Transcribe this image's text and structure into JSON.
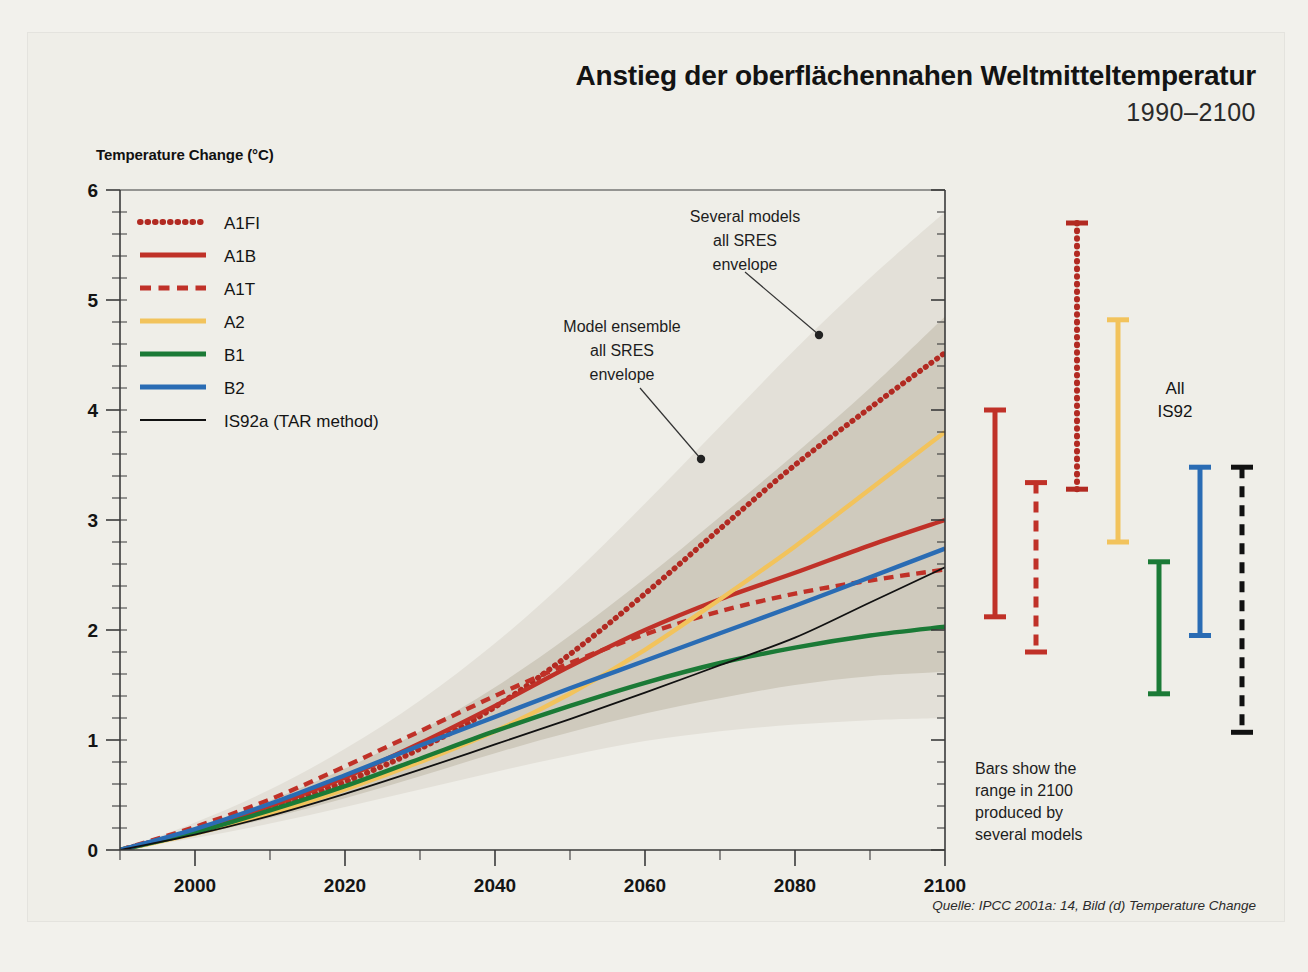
{
  "header": {
    "title": "Anstieg der oberflächennahen Weltmitteltemperatur",
    "subtitle": "1990–2100"
  },
  "source": "Quelle: IPCC 2001a: 14, Bild (d) Temperature Change",
  "axis": {
    "ylabel": "Temperature Change (°C)",
    "yticks": [
      "0",
      "1",
      "2",
      "3",
      "4",
      "5",
      "6"
    ],
    "xticks": [
      "2000",
      "2020",
      "2040",
      "2060",
      "2080",
      "2100"
    ]
  },
  "legend": {
    "items": [
      {
        "label": "A1FI",
        "color": "#b22a22",
        "style": "dotted"
      },
      {
        "label": "A1B",
        "color": "#c03128",
        "style": "solid"
      },
      {
        "label": "A1T",
        "color": "#c03128",
        "style": "dashed"
      },
      {
        "label": "A2",
        "color": "#f2c35c",
        "style": "solid"
      },
      {
        "label": "B1",
        "color": "#1b7a36",
        "style": "solid"
      },
      {
        "label": "B2",
        "color": "#2a6cb4",
        "style": "solid"
      },
      {
        "label": "IS92a (TAR method)",
        "color": "#111111",
        "style": "thin"
      }
    ]
  },
  "annotations": {
    "several_models": "Several models\nall SRES\nenvelope",
    "several_models_lines": [
      "Several models",
      "all SRES",
      "envelope"
    ],
    "model_ensemble_lines": [
      "Model ensemble",
      "all SRES",
      "envelope"
    ],
    "bars_note_lines": [
      "Bars show the",
      "range in 2100",
      "produced by",
      "several models"
    ],
    "all_is92_lines": [
      "All",
      "IS92"
    ]
  },
  "colors": {
    "outer_envelope": "#e3e0d8",
    "inner_envelope": "#cfcabd",
    "paper": "#f2f1ec",
    "panel": "#efeee8",
    "axis": "#3a3a3a"
  },
  "chart_data": {
    "type": "line",
    "title": "Anstieg der oberflächennahen Weltmitteltemperatur 1990–2100",
    "xlabel": "",
    "ylabel": "Temperature Change (°C)",
    "xlim": [
      1990,
      2100
    ],
    "ylim": [
      0,
      6
    ],
    "grid": false,
    "legend_position": "upper-left-inside",
    "x": [
      1990,
      2000,
      2010,
      2020,
      2030,
      2040,
      2050,
      2060,
      2070,
      2080,
      2090,
      2100
    ],
    "series": [
      {
        "name": "A1FI",
        "color": "#b22a22",
        "style": "dotted",
        "values": [
          0.0,
          0.17,
          0.38,
          0.62,
          0.92,
          1.3,
          1.78,
          2.33,
          2.92,
          3.5,
          4.02,
          4.52
        ]
      },
      {
        "name": "A1B",
        "color": "#c03128",
        "style": "solid",
        "values": [
          0.0,
          0.18,
          0.4,
          0.66,
          0.97,
          1.31,
          1.67,
          2.0,
          2.28,
          2.52,
          2.77,
          3.0
        ]
      },
      {
        "name": "A1T",
        "color": "#c03128",
        "style": "dashed",
        "values": [
          0.0,
          0.21,
          0.46,
          0.76,
          1.08,
          1.4,
          1.7,
          1.96,
          2.17,
          2.33,
          2.45,
          2.55
        ]
      },
      {
        "name": "A2",
        "color": "#f2c35c",
        "style": "solid",
        "values": [
          0.0,
          0.15,
          0.33,
          0.55,
          0.8,
          1.08,
          1.42,
          1.82,
          2.28,
          2.76,
          3.28,
          3.8
        ]
      },
      {
        "name": "B1",
        "color": "#1b7a36",
        "style": "solid",
        "values": [
          0.0,
          0.16,
          0.36,
          0.58,
          0.83,
          1.08,
          1.31,
          1.52,
          1.7,
          1.84,
          1.95,
          2.03
        ]
      },
      {
        "name": "B2",
        "color": "#2a6cb4",
        "style": "solid",
        "values": [
          0.0,
          0.19,
          0.42,
          0.68,
          0.95,
          1.21,
          1.47,
          1.72,
          1.97,
          2.22,
          2.48,
          2.74
        ]
      },
      {
        "name": "IS92a (TAR method)",
        "color": "#111111",
        "style": "thin",
        "values": [
          0.0,
          0.14,
          0.31,
          0.51,
          0.73,
          0.96,
          1.19,
          1.43,
          1.68,
          1.93,
          2.25,
          2.57
        ]
      }
    ],
    "envelopes": [
      {
        "name": "Several models all SRES envelope",
        "color": "#e3e0d8",
        "upper": [
          0.0,
          0.25,
          0.55,
          0.92,
          1.36,
          1.88,
          2.48,
          3.15,
          3.85,
          4.55,
          5.2,
          5.8
        ],
        "lower": [
          0.0,
          0.11,
          0.24,
          0.39,
          0.55,
          0.71,
          0.86,
          0.99,
          1.08,
          1.14,
          1.18,
          1.2
        ]
      },
      {
        "name": "Model ensemble all SRES envelope",
        "color": "#cfcabd",
        "upper": [
          0.0,
          0.2,
          0.45,
          0.74,
          1.08,
          1.48,
          1.95,
          2.47,
          3.03,
          3.6,
          4.2,
          4.85
        ],
        "lower": [
          0.0,
          0.13,
          0.29,
          0.47,
          0.67,
          0.88,
          1.07,
          1.24,
          1.38,
          1.5,
          1.58,
          1.62
        ]
      }
    ],
    "range_bars": {
      "note": "Bars show the range in 2100 produced by several models",
      "bars": [
        {
          "name": "A1B",
          "color": "#c03128",
          "style": "solid",
          "low": 2.12,
          "high": 4.0
        },
        {
          "name": "A1T",
          "color": "#c03128",
          "style": "dashed",
          "low": 1.8,
          "high": 3.34
        },
        {
          "name": "A1FI",
          "color": "#b22a22",
          "style": "dotted",
          "low": 3.28,
          "high": 5.7
        },
        {
          "name": "A2",
          "color": "#f2c35c",
          "style": "solid",
          "low": 2.8,
          "high": 4.82
        },
        {
          "name": "B1",
          "color": "#1b7a36",
          "style": "solid",
          "low": 1.42,
          "high": 2.62
        },
        {
          "name": "B2",
          "color": "#2a6cb4",
          "style": "solid",
          "low": 1.95,
          "high": 3.48
        },
        {
          "name": "All IS92",
          "color": "#111111",
          "style": "dashed",
          "low": 1.07,
          "high": 3.48
        }
      ]
    }
  }
}
